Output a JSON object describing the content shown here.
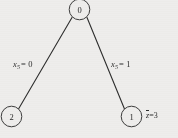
{
  "figure": {
    "type": "branch-and-bound-tree",
    "background_color": "#f3f2f0",
    "stroke_color": "#2b2b2b",
    "nodes": [
      {
        "id": "root",
        "label": "0",
        "cx": 79.5,
        "cy": 9.5,
        "r": 10.5
      },
      {
        "id": "left",
        "label": "2",
        "cx": 11.5,
        "cy": 116.5,
        "r": 10.5
      },
      {
        "id": "right",
        "label": "1",
        "cx": 131.5,
        "cy": 116.5,
        "r": 10.5
      }
    ],
    "edges": [
      {
        "id": "root-to-left",
        "from": "root",
        "to": "left",
        "x1": 72.0,
        "y1": 17.5,
        "x2": 18.5,
        "y2": 109.0
      },
      {
        "id": "root-to-right",
        "from": "root",
        "to": "right",
        "x1": 87.0,
        "y1": 17.5,
        "x2": 124.5,
        "y2": 109.0
      }
    ],
    "edge_labels": [
      {
        "id": "left-branch-label",
        "variable": "x",
        "subscript": "5",
        "equals": "=",
        "value": "0"
      },
      {
        "id": "right-branch-label",
        "variable": "x",
        "subscript": "5",
        "equals": "=",
        "value": "1"
      }
    ],
    "annotations": [
      {
        "id": "bound-label",
        "symbol": "z",
        "equals": "=",
        "value": "3",
        "near_node": "1"
      }
    ]
  }
}
